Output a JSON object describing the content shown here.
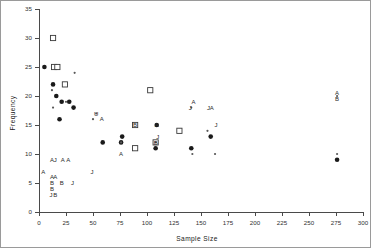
{
  "chart_data": {
    "type": "scatter",
    "title": "",
    "xlabel": "Sample Size",
    "ylabel": "Frequency",
    "xlim": [
      0,
      300
    ],
    "ylim": [
      0,
      35
    ],
    "xticks": [
      0,
      25,
      50,
      75,
      100,
      125,
      150,
      175,
      200,
      225,
      250,
      275,
      300
    ],
    "xtick_labels": [
      "0",
      "25",
      "50",
      "75",
      "100",
      "125",
      "150",
      "175",
      "200",
      "225",
      "250",
      "275",
      "300"
    ],
    "yticks": [
      0,
      5,
      10,
      15,
      20,
      25,
      30,
      35
    ],
    "ytick_labels": [
      "0",
      "5",
      "10",
      "15",
      "20",
      "25",
      "30",
      "35"
    ],
    "grid": false,
    "legend": "none",
    "series": [
      {
        "name": "filled-circle",
        "marker": "filled-circle",
        "points": [
          {
            "x": 5,
            "y": 25
          },
          {
            "x": 13,
            "y": 22
          },
          {
            "x": 16,
            "y": 20
          },
          {
            "x": 19,
            "y": 16
          },
          {
            "x": 21,
            "y": 19
          },
          {
            "x": 28,
            "y": 19
          },
          {
            "x": 32,
            "y": 18
          },
          {
            "x": 59,
            "y": 12
          },
          {
            "x": 76,
            "y": 12
          },
          {
            "x": 77,
            "y": 13
          },
          {
            "x": 108,
            "y": 11
          },
          {
            "x": 109,
            "y": 15
          },
          {
            "x": 130,
            "y": 14
          },
          {
            "x": 141,
            "y": 11
          },
          {
            "x": 159,
            "y": 13
          },
          {
            "x": 276,
            "y": 9
          }
        ]
      },
      {
        "name": "open-square",
        "marker": "open-square",
        "points": [
          {
            "x": 13,
            "y": 30
          },
          {
            "x": 14,
            "y": 25
          },
          {
            "x": 17,
            "y": 25
          },
          {
            "x": 24,
            "y": 22
          },
          {
            "x": 89,
            "y": 15
          },
          {
            "x": 89,
            "y": 11
          },
          {
            "x": 103,
            "y": 21
          },
          {
            "x": 108,
            "y": 12
          },
          {
            "x": 130,
            "y": 14
          }
        ]
      },
      {
        "name": "small-dot",
        "marker": "small-dot",
        "points": [
          {
            "x": 12,
            "y": 21
          },
          {
            "x": 13,
            "y": 18
          },
          {
            "x": 25,
            "y": 19
          },
          {
            "x": 33,
            "y": 24
          },
          {
            "x": 50,
            "y": 16
          },
          {
            "x": 53,
            "y": 17
          },
          {
            "x": 76,
            "y": 12
          },
          {
            "x": 108,
            "y": 12
          },
          {
            "x": 141,
            "y": 18
          },
          {
            "x": 142,
            "y": 10
          },
          {
            "x": 156,
            "y": 14
          },
          {
            "x": 163,
            "y": 10
          },
          {
            "x": 276,
            "y": 20
          },
          {
            "x": 276,
            "y": 10
          }
        ]
      }
    ],
    "annotations": [
      {
        "text": "A",
        "x": 4,
        "y": 7
      },
      {
        "text": "A",
        "x": 12,
        "y": 9
      },
      {
        "text": "J",
        "x": 15,
        "y": 9
      },
      {
        "text": "A",
        "x": 22,
        "y": 9
      },
      {
        "text": "A",
        "x": 27,
        "y": 9
      },
      {
        "text": "A",
        "x": 12,
        "y": 6
      },
      {
        "text": "A",
        "x": 15,
        "y": 6
      },
      {
        "text": "B",
        "x": 12,
        "y": 5
      },
      {
        "text": "B",
        "x": 21,
        "y": 5
      },
      {
        "text": "B",
        "x": 12,
        "y": 4
      },
      {
        "text": "J",
        "x": 11,
        "y": 3
      },
      {
        "text": "B",
        "x": 15,
        "y": 3
      },
      {
        "text": "J",
        "x": 31,
        "y": 5
      },
      {
        "text": "J",
        "x": 49,
        "y": 7
      },
      {
        "text": "U",
        "x": 53,
        "y": 17
      },
      {
        "text": "A",
        "x": 58,
        "y": 16
      },
      {
        "text": "A",
        "x": 76,
        "y": 10
      },
      {
        "text": "B",
        "x": 89,
        "y": 15
      },
      {
        "text": "A",
        "x": 109,
        "y": 15
      },
      {
        "text": "J",
        "x": 110,
        "y": 13
      },
      {
        "text": "B",
        "x": 108,
        "y": 12
      },
      {
        "text": "A",
        "x": 143,
        "y": 19
      },
      {
        "text": "J",
        "x": 140,
        "y": 18
      },
      {
        "text": "J",
        "x": 157,
        "y": 18
      },
      {
        "text": "A",
        "x": 160,
        "y": 18
      },
      {
        "text": "J",
        "x": 164,
        "y": 15
      },
      {
        "text": "A",
        "x": 276,
        "y": 20.5
      },
      {
        "text": "B",
        "x": 276,
        "y": 19.5
      }
    ]
  },
  "colors": {
    "axis": "#4a4a4a",
    "marker_filled": "#1a1a1a",
    "marker_open_stroke": "#3a3a3a",
    "background": "#ffffff",
    "frame": "#9a9a9a"
  }
}
